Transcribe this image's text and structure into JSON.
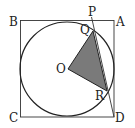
{
  "diagram": {
    "title": "",
    "labels": {
      "A": "A",
      "B": "B",
      "C": "C",
      "D": "D",
      "O": "O",
      "P": "P",
      "Q": "Q",
      "R": "R"
    },
    "shaded_region": "triangle OQR",
    "fill_color": "#7a7a7a",
    "stroke_color": "#222222"
  }
}
